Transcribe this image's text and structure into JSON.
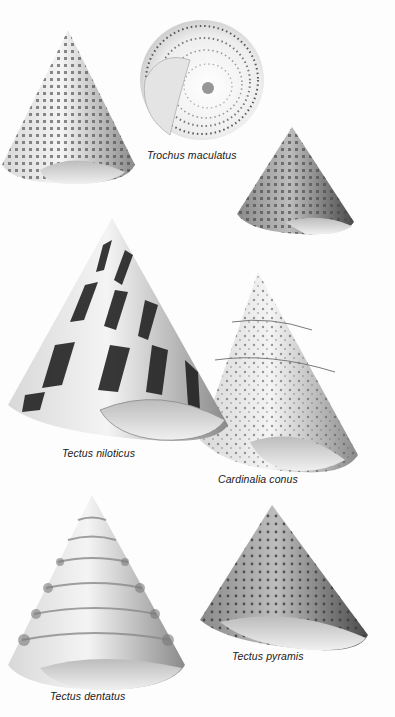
{
  "plate": {
    "background": "#fdfdfd",
    "style": "grayscale illustration plate",
    "specimens": [
      {
        "id": "trochus-side",
        "label": "",
        "description": "conical shell, side view, checkered pattern"
      },
      {
        "id": "trochus-base",
        "label": "Trochus maculatus",
        "description": "basal view with spiral dotted rows"
      },
      {
        "id": "trochus-small",
        "label": "",
        "description": "small dark speckled conical shell"
      },
      {
        "id": "tectus-niloticus",
        "label": "Tectus niloticus",
        "description": "large cone with dark zigzag bands"
      },
      {
        "id": "cardinalia-conus",
        "label": "Cardinalia conus",
        "description": "pale mottled cone shell"
      },
      {
        "id": "tectus-dentatus",
        "label": "Tectus dentatus",
        "description": "white cone with knobbed whorls"
      },
      {
        "id": "tectus-pyramis",
        "label": "Tectus pyramis",
        "description": "grey beaded cone shell"
      }
    ]
  },
  "labels": {
    "trochus_maculatus": "Trochus maculatus",
    "tectus_niloticus": "Tectus niloticus",
    "cardinalia_conus": "Cardinalia conus",
    "tectus_pyramis": "Tectus pyramis",
    "tectus_dentatus": "Tectus dentatus"
  },
  "colors": {
    "shell_light": "#e8e8e8",
    "shell_mid": "#9a9a9a",
    "shell_dark": "#2a2a2a",
    "text": "#1a1a1a"
  }
}
